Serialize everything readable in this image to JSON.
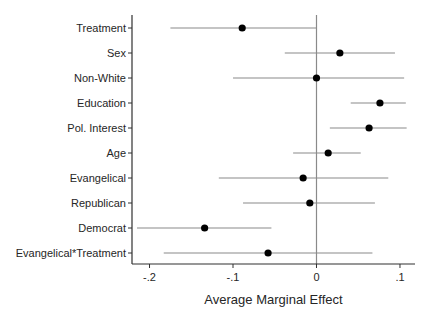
{
  "figure": {
    "background": "#ffffff"
  },
  "chart_data": {
    "type": "scatter",
    "subtype": "coefficient-forest-plot",
    "title": "",
    "xlabel": "Average Marginal Effect",
    "ylabel": "",
    "xlim": [
      -0.221,
      0.118
    ],
    "x_ticks": [
      -0.2,
      -0.1,
      0,
      0.1
    ],
    "x_tick_labels": [
      "-.2",
      "-.1",
      "0",
      ".1"
    ],
    "zero_line_at": 0,
    "grid": false,
    "legend": false,
    "categories": [
      "Treatment",
      "Sex",
      "Non-White",
      "Education",
      "Pol. Interest",
      "Age",
      "Evangelical",
      "Republican",
      "Democrat",
      "Evangelical*Treatment"
    ],
    "series": [
      {
        "name": "Average Marginal Effect",
        "estimates": [
          -0.089,
          0.028,
          0.0,
          0.076,
          0.063,
          0.014,
          -0.016,
          -0.008,
          -0.134,
          -0.058
        ],
        "ci_low": [
          -0.175,
          -0.038,
          -0.1,
          0.041,
          0.016,
          -0.028,
          -0.117,
          -0.088,
          -0.215,
          -0.183
        ],
        "ci_high": [
          0.0,
          0.094,
          0.105,
          0.107,
          0.108,
          0.053,
          0.086,
          0.07,
          -0.054,
          0.067
        ]
      }
    ],
    "colors": {
      "marker": "#000000",
      "ci_line": "#8a8a8a",
      "zero_line": "#8a8a8a",
      "axis": "#303030",
      "text": "#262626"
    }
  }
}
